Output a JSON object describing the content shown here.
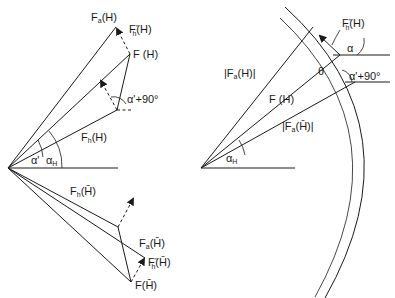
{
  "left_diagram": {
    "labels": {
      "fa_h": "F",
      "fa_h_sub": "a",
      "fa_h_arg": "(H)",
      "fh2_h": "F",
      "fh2_h_sub": "h",
      "fh2_h_sup": "''",
      "fh2_h_arg": "(H)",
      "f_h": "F (H)",
      "alpha90": "α'+90°",
      "fh_h": "F",
      "fh_h_sub": "h",
      "fh_h_arg": "(H)",
      "alpha_prime": "α'",
      "alpha_h": "α",
      "alpha_h_sub": "H",
      "fh_hbar": "F",
      "fh_hbar_sub": "h",
      "fh_hbar_arg": "(H̄)",
      "fa_hbar": "F",
      "fa_hbar_sub": "a",
      "fa_hbar_arg": "(H̄)",
      "fh2_hbar": "F",
      "fh2_hbar_sub": "h",
      "fh2_hbar_sup": "''",
      "fh2_hbar_arg": "(H̄)",
      "f_hbar": "F(H̄)"
    }
  },
  "right_diagram": {
    "labels": {
      "fh2_h": "F",
      "fh2_h_sub": "h",
      "fh2_h_sup": "''",
      "fh2_h_arg": "(H)",
      "alpha": "α",
      "theta": "θ",
      "alpha90": "α'+90°",
      "abs_fa_h": "|F",
      "abs_fa_h_sub": "a",
      "abs_fa_h_arg": "(H)|",
      "f_h": "F (H)",
      "abs_fa_hbar": "|F",
      "abs_fa_hbar_sub": "a",
      "abs_fa_hbar_arg": "(H̄)|",
      "alpha_h": "α",
      "alpha_h_sub": "H"
    }
  }
}
